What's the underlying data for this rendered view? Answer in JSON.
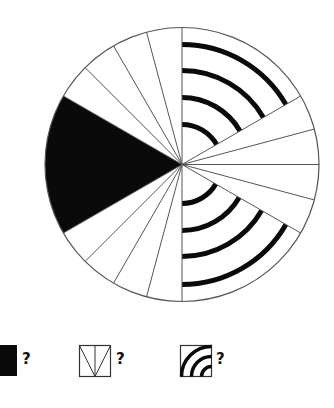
{
  "diagram": {
    "center": [
      182,
      164.5
    ],
    "radius": 137,
    "outline_color": "#555555",
    "fill_color": "#0a0a0a",
    "background": "#ffffff",
    "divider_angles_deg": [
      90,
      105,
      120,
      135,
      150,
      210,
      225,
      240,
      255,
      270,
      30,
      15,
      0,
      -15,
      -30
    ],
    "black_sector": {
      "from_deg": 150,
      "to_deg": 210
    },
    "arc_sectors": [
      {
        "from_deg": 30,
        "to_deg": 90,
        "radii": [
          40,
          67,
          94,
          120
        ],
        "stroke_width": 5
      },
      {
        "from_deg": -90,
        "to_deg": -30,
        "radii": [
          39,
          66,
          92,
          120
        ],
        "stroke_width": 5
      }
    ]
  },
  "legend": [
    {
      "id": "black-sector",
      "symbol": "filled-square",
      "label": "?"
    },
    {
      "id": "narrow-sectors",
      "symbol": "square-with-sector-lines",
      "label": "?"
    },
    {
      "id": "arc-sectors",
      "symbol": "square-with-arcs",
      "label": "?"
    }
  ]
}
